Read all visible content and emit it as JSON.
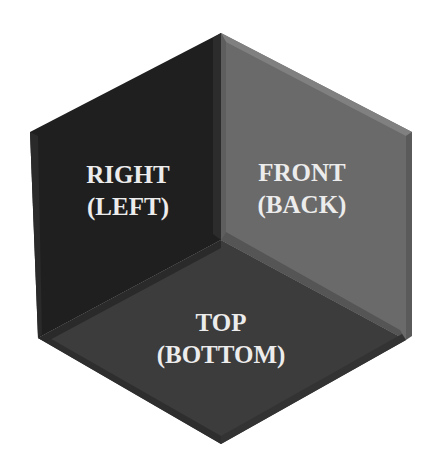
{
  "diagram": {
    "type": "isometric-cube-interior-faces",
    "faces": [
      {
        "id": "right",
        "line1": "RIGHT",
        "line2": "(LEFT)",
        "color": "#202020"
      },
      {
        "id": "front",
        "line1": "FRONT",
        "line2": "(BACK)",
        "color": "#6b6b6b"
      },
      {
        "id": "top",
        "line1": "TOP",
        "line2": "(BOTTOM)",
        "color": "#3d3d3d"
      }
    ],
    "edge_color": "#4a4a4a",
    "background": "#ffffff"
  }
}
